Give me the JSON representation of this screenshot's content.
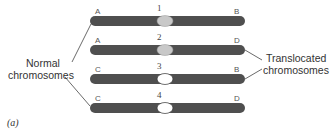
{
  "diagram": {
    "caption": "(a)",
    "colors": {
      "chromosome_arm": "#4f4f4f",
      "centromere_normal": "#c8c8c8",
      "centromere_translocated": "#ffffff",
      "leader_line": "#444444"
    },
    "groups": {
      "normal": {
        "line1": "Normal",
        "line2": "chromosomes"
      },
      "translocated": {
        "line1": "Translocated",
        "line2": "chromosomes"
      }
    },
    "chromosomes": [
      {
        "number": "1",
        "left_label": "A",
        "right_label": "B",
        "centromere": "gray"
      },
      {
        "number": "2",
        "left_label": "A",
        "right_label": "D",
        "centromere": "gray"
      },
      {
        "number": "3",
        "left_label": "C",
        "right_label": "B",
        "centromere": "white"
      },
      {
        "number": "4",
        "left_label": "C",
        "right_label": "D",
        "centromere": "white"
      }
    ]
  }
}
